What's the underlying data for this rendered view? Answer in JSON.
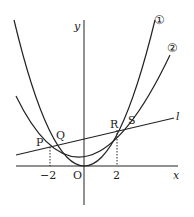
{
  "diagram": {
    "axes": {
      "x_label": "x",
      "y_label": "y",
      "origin_label": "O"
    },
    "ticks": {
      "neg": "−2",
      "pos": "2"
    },
    "curves": [
      {
        "id": "1",
        "label": "①",
        "equation_hint": "y = a₁x² (steeper)"
      },
      {
        "id": "2",
        "label": "②",
        "equation_hint": "y = a₂x² (wider)"
      }
    ],
    "line": {
      "label": "l"
    },
    "points": {
      "P": "P",
      "Q": "Q",
      "R": "R",
      "S": "S"
    },
    "colors": {
      "stroke": "#222222",
      "background": "#ffffff"
    }
  }
}
